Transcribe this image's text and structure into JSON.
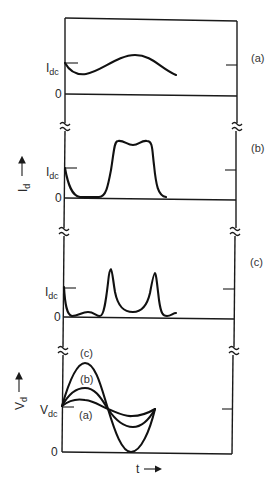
{
  "figure": {
    "panels": [
      {
        "id": "a",
        "label": "(a)",
        "y_ref_label": "I",
        "y_ref_sub": "dc",
        "zero_label": "0"
      },
      {
        "id": "b",
        "label": "(b)",
        "y_ref_label": "I",
        "y_ref_sub": "dc",
        "zero_label": "0"
      },
      {
        "id": "c",
        "label": "(c)",
        "y_ref_label": "I",
        "y_ref_sub": "dc",
        "zero_label": "0"
      },
      {
        "id": "d",
        "y_ref_label": "V",
        "y_ref_sub": "dc",
        "zero_label": "0",
        "curve_labels": [
          "(c)",
          "(b)",
          "(a)"
        ]
      }
    ],
    "current_axis": {
      "label": "I",
      "sub": "d"
    },
    "voltage_axis": {
      "label": "V",
      "sub": "d"
    },
    "time_axis": {
      "label": "t"
    }
  }
}
